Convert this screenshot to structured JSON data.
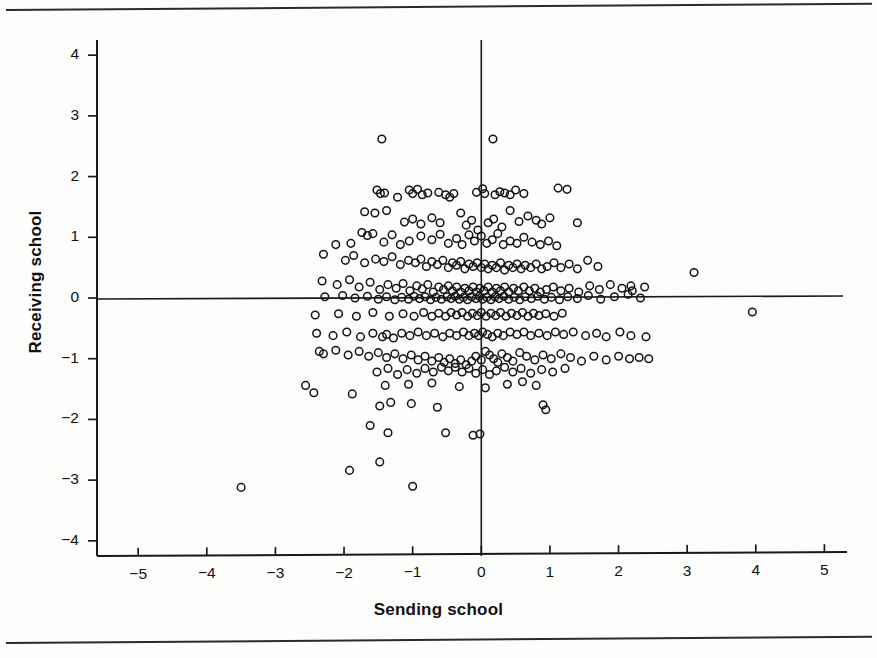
{
  "figure": {
    "background_color": "#fdfdfc",
    "ink_color": "#1a1a1a",
    "rule_color": "#2b2b2b"
  },
  "chart_data": {
    "type": "scatter",
    "title": "",
    "xlabel": "Sending school",
    "ylabel": "Receiving school",
    "xlim": [
      -5.6,
      5.3
    ],
    "ylim": [
      -4.25,
      4.25
    ],
    "xticks": [
      -5,
      -4,
      -3,
      -2,
      -1,
      0,
      1,
      2,
      3,
      4,
      5
    ],
    "xticklabels": [
      "−5",
      "−4",
      "−3",
      "−2",
      "−1",
      "0",
      "1",
      "2",
      "3",
      "4",
      "5"
    ],
    "yticks": [
      4,
      3,
      2,
      1,
      0,
      -1,
      -2,
      -3,
      -4
    ],
    "yticklabels": [
      "4",
      "3",
      "2",
      "1",
      "0",
      "−1",
      "−2",
      "−3",
      "−4"
    ],
    "grid": false,
    "legend": null,
    "reference_lines": [
      {
        "orientation": "vertical",
        "value": 0
      },
      {
        "orientation": "horizontal",
        "value": 0
      }
    ],
    "marker": {
      "shape": "open-circle",
      "size_px": 7.6,
      "edge_color": "#141414",
      "face_color": "none",
      "edge_width_px": 1.5
    },
    "n_points": 402,
    "points": [
      [
        -1.45,
        2.62
      ],
      [
        0.17,
        2.62
      ],
      [
        -1.52,
        1.78
      ],
      [
        -1.47,
        1.72
      ],
      [
        -1.41,
        1.73
      ],
      [
        -1.22,
        1.66
      ],
      [
        -1.05,
        1.78
      ],
      [
        -1.0,
        1.72
      ],
      [
        -0.93,
        1.79
      ],
      [
        -0.86,
        1.7
      ],
      [
        -0.78,
        1.73
      ],
      [
        -0.62,
        1.74
      ],
      [
        -0.52,
        1.7
      ],
      [
        -0.46,
        1.66
      ],
      [
        -0.4,
        1.72
      ],
      [
        -0.07,
        1.74
      ],
      [
        0.02,
        1.8
      ],
      [
        0.05,
        1.72
      ],
      [
        0.2,
        1.7
      ],
      [
        0.27,
        1.75
      ],
      [
        0.34,
        1.73
      ],
      [
        0.42,
        1.7
      ],
      [
        0.5,
        1.78
      ],
      [
        0.62,
        1.72
      ],
      [
        1.12,
        1.81
      ],
      [
        1.25,
        1.79
      ],
      [
        -1.7,
        1.42
      ],
      [
        -1.55,
        1.4
      ],
      [
        -1.38,
        1.44
      ],
      [
        -1.12,
        1.25
      ],
      [
        -1.0,
        1.3
      ],
      [
        -0.88,
        1.22
      ],
      [
        -0.72,
        1.32
      ],
      [
        -0.6,
        1.24
      ],
      [
        -0.3,
        1.4
      ],
      [
        -0.22,
        1.2
      ],
      [
        -0.14,
        1.28
      ],
      [
        -0.05,
        1.12
      ],
      [
        0.1,
        1.24
      ],
      [
        0.18,
        1.3
      ],
      [
        0.3,
        1.17
      ],
      [
        0.42,
        1.44
      ],
      [
        0.55,
        1.26
      ],
      [
        0.68,
        1.35
      ],
      [
        0.8,
        1.28
      ],
      [
        0.88,
        1.22
      ],
      [
        1.0,
        1.32
      ],
      [
        1.4,
        1.24
      ],
      [
        -1.9,
        0.9
      ],
      [
        -1.74,
        1.08
      ],
      [
        -1.66,
        1.03
      ],
      [
        -1.58,
        1.06
      ],
      [
        -1.42,
        0.92
      ],
      [
        -1.3,
        1.04
      ],
      [
        -1.18,
        0.88
      ],
      [
        -1.05,
        0.94
      ],
      [
        -0.88,
        1.02
      ],
      [
        -0.72,
        0.96
      ],
      [
        -0.6,
        1.05
      ],
      [
        -0.48,
        0.9
      ],
      [
        -0.36,
        0.98
      ],
      [
        -0.28,
        0.88
      ],
      [
        -0.18,
        1.04
      ],
      [
        -0.1,
        0.94
      ],
      [
        0.0,
        1.02
      ],
      [
        0.08,
        0.9
      ],
      [
        0.16,
        0.96
      ],
      [
        0.24,
        1.06
      ],
      [
        0.32,
        0.88
      ],
      [
        0.42,
        0.94
      ],
      [
        0.52,
        0.9
      ],
      [
        0.62,
        1.0
      ],
      [
        0.74,
        0.92
      ],
      [
        0.86,
        0.88
      ],
      [
        0.98,
        0.94
      ],
      [
        1.1,
        0.86
      ],
      [
        -2.3,
        0.72
      ],
      [
        -2.12,
        0.88
      ],
      [
        -1.98,
        0.62
      ],
      [
        -1.86,
        0.7
      ],
      [
        -1.7,
        0.58
      ],
      [
        -1.54,
        0.64
      ],
      [
        -1.42,
        0.6
      ],
      [
        -1.3,
        0.68
      ],
      [
        -1.18,
        0.55
      ],
      [
        -1.06,
        0.62
      ],
      [
        -0.96,
        0.58
      ],
      [
        -0.88,
        0.64
      ],
      [
        -0.8,
        0.52
      ],
      [
        -0.72,
        0.6
      ],
      [
        -0.64,
        0.55
      ],
      [
        -0.56,
        0.62
      ],
      [
        -0.48,
        0.5
      ],
      [
        -0.42,
        0.58
      ],
      [
        -0.36,
        0.54
      ],
      [
        -0.3,
        0.6
      ],
      [
        -0.24,
        0.48
      ],
      [
        -0.18,
        0.56
      ],
      [
        -0.12,
        0.52
      ],
      [
        -0.06,
        0.58
      ],
      [
        0.0,
        0.5
      ],
      [
        0.05,
        0.56
      ],
      [
        0.1,
        0.48
      ],
      [
        0.16,
        0.54
      ],
      [
        0.22,
        0.5
      ],
      [
        0.28,
        0.58
      ],
      [
        0.34,
        0.46
      ],
      [
        0.4,
        0.54
      ],
      [
        0.46,
        0.5
      ],
      [
        0.52,
        0.56
      ],
      [
        0.58,
        0.48
      ],
      [
        0.64,
        0.54
      ],
      [
        0.72,
        0.5
      ],
      [
        0.8,
        0.56
      ],
      [
        0.88,
        0.48
      ],
      [
        0.96,
        0.52
      ],
      [
        1.06,
        0.58
      ],
      [
        1.16,
        0.5
      ],
      [
        1.28,
        0.56
      ],
      [
        1.4,
        0.48
      ],
      [
        1.55,
        0.62
      ],
      [
        1.7,
        0.52
      ],
      [
        3.1,
        0.42
      ],
      [
        -2.32,
        0.28
      ],
      [
        -2.1,
        0.22
      ],
      [
        -1.92,
        0.3
      ],
      [
        -1.78,
        0.18
      ],
      [
        -1.62,
        0.26
      ],
      [
        -1.48,
        0.14
      ],
      [
        -1.36,
        0.22
      ],
      [
        -1.24,
        0.16
      ],
      [
        -1.14,
        0.24
      ],
      [
        -1.04,
        0.12
      ],
      [
        -0.94,
        0.2
      ],
      [
        -0.86,
        0.15
      ],
      [
        -0.78,
        0.22
      ],
      [
        -0.7,
        0.1
      ],
      [
        -0.62,
        0.18
      ],
      [
        -0.55,
        0.14
      ],
      [
        -0.48,
        0.2
      ],
      [
        -0.42,
        0.12
      ],
      [
        -0.36,
        0.18
      ],
      [
        -0.3,
        0.1
      ],
      [
        -0.24,
        0.16
      ],
      [
        -0.18,
        0.12
      ],
      [
        -0.12,
        0.18
      ],
      [
        -0.07,
        0.1
      ],
      [
        -0.02,
        0.16
      ],
      [
        0.04,
        0.12
      ],
      [
        0.1,
        0.18
      ],
      [
        0.16,
        0.1
      ],
      [
        0.22,
        0.16
      ],
      [
        0.28,
        0.12
      ],
      [
        0.34,
        0.18
      ],
      [
        0.4,
        0.1
      ],
      [
        0.47,
        0.16
      ],
      [
        0.54,
        0.12
      ],
      [
        0.62,
        0.18
      ],
      [
        0.7,
        0.12
      ],
      [
        0.78,
        0.16
      ],
      [
        0.86,
        0.1
      ],
      [
        0.95,
        0.14
      ],
      [
        1.05,
        0.18
      ],
      [
        1.16,
        0.12
      ],
      [
        1.28,
        0.16
      ],
      [
        1.42,
        0.1
      ],
      [
        1.58,
        0.2
      ],
      [
        1.72,
        0.14
      ],
      [
        1.88,
        0.22
      ],
      [
        2.05,
        0.16
      ],
      [
        2.18,
        0.2
      ],
      [
        2.2,
        0.12
      ],
      [
        2.38,
        0.18
      ],
      [
        -2.28,
        0.02
      ],
      [
        -2.02,
        0.04
      ],
      [
        -1.84,
        0.0
      ],
      [
        -1.66,
        0.03
      ],
      [
        -1.5,
        -0.02
      ],
      [
        -1.38,
        0.02
      ],
      [
        -1.26,
        -0.03
      ],
      [
        -1.16,
        0.01
      ],
      [
        -1.06,
        -0.02
      ],
      [
        -0.98,
        0.03
      ],
      [
        -0.9,
        -0.01
      ],
      [
        -0.82,
        0.02
      ],
      [
        -0.74,
        -0.03
      ],
      [
        -0.66,
        0.01
      ],
      [
        -0.58,
        -0.02
      ],
      [
        -0.5,
        0.02
      ],
      [
        -0.44,
        -0.01
      ],
      [
        -0.38,
        0.03
      ],
      [
        -0.32,
        -0.02
      ],
      [
        -0.26,
        0.01
      ],
      [
        -0.2,
        -0.03
      ],
      [
        -0.14,
        0.02
      ],
      [
        -0.08,
        -0.01
      ],
      [
        -0.03,
        0.03
      ],
      [
        0.02,
        -0.02
      ],
      [
        0.08,
        0.01
      ],
      [
        0.14,
        -0.03
      ],
      [
        0.2,
        0.02
      ],
      [
        0.26,
        -0.01
      ],
      [
        0.33,
        0.03
      ],
      [
        0.4,
        -0.02
      ],
      [
        0.48,
        0.01
      ],
      [
        0.56,
        -0.03
      ],
      [
        0.64,
        0.02
      ],
      [
        0.73,
        -0.01
      ],
      [
        0.82,
        0.03
      ],
      [
        0.92,
        -0.02
      ],
      [
        1.02,
        0.01
      ],
      [
        1.14,
        -0.03
      ],
      [
        1.26,
        0.02
      ],
      [
        1.4,
        -0.01
      ],
      [
        1.56,
        0.04
      ],
      [
        1.74,
        -0.02
      ],
      [
        1.94,
        0.02
      ],
      [
        2.14,
        0.06
      ],
      [
        2.32,
        0.0
      ],
      [
        -2.42,
        -0.28
      ],
      [
        -2.08,
        -0.26
      ],
      [
        -1.82,
        -0.3
      ],
      [
        -1.58,
        -0.24
      ],
      [
        -1.34,
        -0.3
      ],
      [
        -1.14,
        -0.26
      ],
      [
        -0.98,
        -0.3
      ],
      [
        -0.84,
        -0.24
      ],
      [
        -0.72,
        -0.3
      ],
      [
        -0.62,
        -0.25
      ],
      [
        -0.52,
        -0.3
      ],
      [
        -0.44,
        -0.24
      ],
      [
        -0.36,
        -0.28
      ],
      [
        -0.28,
        -0.24
      ],
      [
        -0.2,
        -0.3
      ],
      [
        -0.13,
        -0.25
      ],
      [
        -0.06,
        -0.29
      ],
      [
        0.0,
        -0.24
      ],
      [
        0.07,
        -0.3
      ],
      [
        0.14,
        -0.25
      ],
      [
        0.21,
        -0.29
      ],
      [
        0.28,
        -0.24
      ],
      [
        0.36,
        -0.3
      ],
      [
        0.44,
        -0.25
      ],
      [
        0.52,
        -0.29
      ],
      [
        0.6,
        -0.24
      ],
      [
        0.68,
        -0.3
      ],
      [
        0.76,
        -0.25
      ],
      [
        0.84,
        -0.29
      ],
      [
        0.94,
        -0.26
      ],
      [
        1.06,
        -0.3
      ],
      [
        1.18,
        -0.25
      ],
      [
        3.95,
        -0.23
      ],
      [
        -2.4,
        -0.58
      ],
      [
        -2.16,
        -0.62
      ],
      [
        -1.96,
        -0.56
      ],
      [
        -1.76,
        -0.64
      ],
      [
        -1.58,
        -0.58
      ],
      [
        -1.44,
        -0.64
      ],
      [
        -1.38,
        -0.6
      ],
      [
        -1.28,
        -0.66
      ],
      [
        -1.16,
        -0.58
      ],
      [
        -1.04,
        -0.62
      ],
      [
        -0.92,
        -0.56
      ],
      [
        -0.8,
        -0.62
      ],
      [
        -0.68,
        -0.58
      ],
      [
        -0.56,
        -0.64
      ],
      [
        -0.46,
        -0.58
      ],
      [
        -0.36,
        -0.62
      ],
      [
        -0.26,
        -0.56
      ],
      [
        -0.18,
        -0.62
      ],
      [
        -0.1,
        -0.58
      ],
      [
        -0.04,
        -0.62
      ],
      [
        0.02,
        -0.56
      ],
      [
        0.09,
        -0.6
      ],
      [
        0.16,
        -0.64
      ],
      [
        0.24,
        -0.58
      ],
      [
        0.32,
        -0.62
      ],
      [
        0.42,
        -0.56
      ],
      [
        0.52,
        -0.6
      ],
      [
        0.62,
        -0.56
      ],
      [
        0.72,
        -0.62
      ],
      [
        0.84,
        -0.58
      ],
      [
        0.96,
        -0.62
      ],
      [
        1.08,
        -0.56
      ],
      [
        1.2,
        -0.6
      ],
      [
        1.34,
        -0.56
      ],
      [
        1.52,
        -0.62
      ],
      [
        1.68,
        -0.58
      ],
      [
        1.82,
        -0.64
      ],
      [
        2.02,
        -0.56
      ],
      [
        2.18,
        -0.62
      ],
      [
        2.4,
        -0.64
      ],
      [
        -2.36,
        -0.88
      ],
      [
        -2.3,
        -0.92
      ],
      [
        -2.12,
        -0.86
      ],
      [
        -1.94,
        -0.94
      ],
      [
        -1.78,
        -0.88
      ],
      [
        -1.64,
        -0.96
      ],
      [
        -1.5,
        -0.9
      ],
      [
        -1.38,
        -0.98
      ],
      [
        -1.26,
        -0.92
      ],
      [
        -1.14,
        -1.0
      ],
      [
        -1.02,
        -0.94
      ],
      [
        -0.92,
        -1.02
      ],
      [
        -0.82,
        -0.96
      ],
      [
        -0.72,
        -1.04
      ],
      [
        -0.62,
        -0.98
      ],
      [
        -0.54,
        -1.06
      ],
      [
        -0.46,
        -1.0
      ],
      [
        -0.38,
        -1.08
      ],
      [
        -0.3,
        -1.02
      ],
      [
        -0.22,
        -1.1
      ],
      [
        -0.14,
        -1.04
      ],
      [
        -0.08,
        -0.96
      ],
      [
        0.0,
        -1.02
      ],
      [
        0.06,
        -0.88
      ],
      [
        0.12,
        -0.94
      ],
      [
        0.18,
        -1.0
      ],
      [
        0.24,
        -1.06
      ],
      [
        0.3,
        -0.92
      ],
      [
        0.38,
        -0.98
      ],
      [
        0.46,
        -1.04
      ],
      [
        0.56,
        -0.9
      ],
      [
        0.66,
        -0.96
      ],
      [
        0.78,
        -1.02
      ],
      [
        0.9,
        -0.94
      ],
      [
        1.02,
        -1.0
      ],
      [
        1.16,
        -0.92
      ],
      [
        1.3,
        -0.98
      ],
      [
        1.46,
        -1.04
      ],
      [
        1.64,
        -0.96
      ],
      [
        1.82,
        -1.02
      ],
      [
        2.0,
        -0.96
      ],
      [
        2.16,
        -1.0
      ],
      [
        2.3,
        -0.98
      ],
      [
        2.44,
        -1.0
      ],
      [
        -1.52,
        -1.22
      ],
      [
        -1.36,
        -1.16
      ],
      [
        -1.22,
        -1.26
      ],
      [
        -1.08,
        -1.18
      ],
      [
        -0.94,
        -1.24
      ],
      [
        -0.82,
        -1.16
      ],
      [
        -0.7,
        -1.22
      ],
      [
        -0.58,
        -1.14
      ],
      [
        -0.48,
        -1.2
      ],
      [
        -0.38,
        -1.14
      ],
      [
        -0.28,
        -1.22
      ],
      [
        -0.18,
        -1.16
      ],
      [
        -0.08,
        -1.24
      ],
      [
        0.02,
        -1.18
      ],
      [
        0.12,
        -1.26
      ],
      [
        0.22,
        -1.2
      ],
      [
        0.34,
        -1.14
      ],
      [
        0.46,
        -1.22
      ],
      [
        0.58,
        -1.16
      ],
      [
        0.72,
        -1.24
      ],
      [
        0.88,
        -1.18
      ],
      [
        1.04,
        -1.22
      ],
      [
        1.22,
        -1.16
      ],
      [
        -2.56,
        -1.44
      ],
      [
        -2.44,
        -1.56
      ],
      [
        -1.88,
        -1.58
      ],
      [
        -1.4,
        -1.44
      ],
      [
        -1.06,
        -1.42
      ],
      [
        -0.72,
        -1.4
      ],
      [
        -0.32,
        -1.46
      ],
      [
        0.06,
        -1.48
      ],
      [
        0.38,
        -1.42
      ],
      [
        0.6,
        -1.38
      ],
      [
        0.8,
        -1.44
      ],
      [
        -1.48,
        -1.78
      ],
      [
        -1.32,
        -1.72
      ],
      [
        -1.02,
        -1.74
      ],
      [
        -0.64,
        -1.8
      ],
      [
        0.9,
        -1.76
      ],
      [
        0.94,
        -1.84
      ],
      [
        -1.62,
        -2.1
      ],
      [
        -1.36,
        -2.22
      ],
      [
        -0.52,
        -2.22
      ],
      [
        -0.02,
        -2.24
      ],
      [
        -0.12,
        -2.26
      ],
      [
        -1.92,
        -2.84
      ],
      [
        -1.48,
        -2.7
      ],
      [
        -3.5,
        -3.12
      ],
      [
        -1.0,
        -3.1
      ]
    ]
  },
  "axis_titles": {
    "x": "Sending school",
    "y": "Receiving school"
  }
}
